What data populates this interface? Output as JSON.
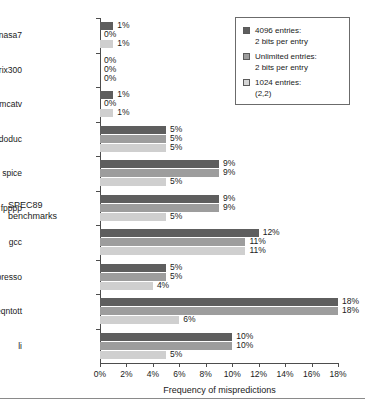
{
  "chart_data": {
    "type": "bar",
    "orientation": "horizontal",
    "title": "",
    "xlabel": "Frequency of mispredictions",
    "ylabel": "SPEC89 benchmarks",
    "xlim": [
      0,
      18
    ],
    "xticks": [
      "0%",
      "2%",
      "4%",
      "6%",
      "8%",
      "10%",
      "12%",
      "14%",
      "16%",
      "18%"
    ],
    "xtick_values": [
      0,
      2,
      4,
      6,
      8,
      10,
      12,
      14,
      16,
      18
    ],
    "grid": false,
    "legend_position": "top-right",
    "categories": [
      "nasa7",
      "matrix300",
      "tomcatv",
      "doduc",
      "spice",
      "fpppp",
      "gcc",
      "espresso",
      "eqntott",
      "li"
    ],
    "series": [
      {
        "name": "4096 entries: 2 bits per entry",
        "color": "#5e5e5e",
        "values": [
          1,
          0,
          1,
          5,
          9,
          9,
          12,
          5,
          18,
          10
        ],
        "labels": [
          "1%",
          "0%",
          "1%",
          "5%",
          "9%",
          "9%",
          "12%",
          "5%",
          "18%",
          "10%"
        ]
      },
      {
        "name": "Unlimited entries: 2 bits per entry",
        "color": "#9d9d9d",
        "values": [
          0,
          0,
          0,
          5,
          9,
          9,
          11,
          5,
          18,
          10
        ],
        "labels": [
          "0%",
          "0%",
          "0%",
          "5%",
          "9%",
          "9%",
          "11%",
          "5%",
          "18%",
          "10%"
        ]
      },
      {
        "name": "1024 entries: (2,2)",
        "color": "#cfcfcf",
        "values": [
          1,
          0,
          1,
          5,
          5,
          5,
          11,
          4,
          6,
          5
        ],
        "labels": [
          "1%",
          "0%",
          "1%",
          "5%",
          "5%",
          "5%",
          "11%",
          "4%",
          "6%",
          "5%"
        ]
      }
    ]
  },
  "legend": {
    "items": [
      {
        "line1": "4096 entries:",
        "line2": "2 bits per entry",
        "swatch": "dark-gray-swatch"
      },
      {
        "line1": "Unlimited entries:",
        "line2": "2 bits per entry",
        "swatch": "medium-gray-swatch"
      },
      {
        "line1": "1024 entries:",
        "line2": "(2,2)",
        "swatch": "light-gray-swatch"
      }
    ]
  },
  "axis": {
    "y_title_line1": "SPEC89",
    "y_title_line2": "benchmarks",
    "x_title": "Frequency of mispredictions"
  }
}
